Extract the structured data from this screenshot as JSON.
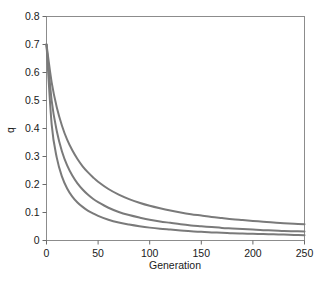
{
  "chart_data": {
    "type": "line",
    "title": "",
    "xlabel": "Generation",
    "ylabel": "q",
    "xlim": [
      0,
      250
    ],
    "ylim": [
      0,
      0.8
    ],
    "grid": false,
    "legend": "none",
    "frame": "full-box",
    "xticks": [
      0,
      50,
      100,
      150,
      200,
      250
    ],
    "xtick_labels": [
      "0",
      "50",
      "100",
      "150",
      "200",
      "250"
    ],
    "yticks": [
      0,
      0.1,
      0.2,
      0.3,
      0.4,
      0.5,
      0.6,
      0.7,
      0.8
    ],
    "ytick_labels": [
      "0",
      "0.1",
      "0.2",
      "0.3",
      "0.4",
      "0.5",
      "0.6",
      "0.7",
      "0.8"
    ],
    "line_color": "#7a7a7a",
    "line_width": 2.0,
    "x": [
      0,
      5,
      10,
      15,
      20,
      25,
      30,
      35,
      40,
      45,
      50,
      60,
      70,
      80,
      90,
      100,
      110,
      120,
      130,
      140,
      150,
      160,
      170,
      180,
      190,
      200,
      210,
      220,
      230,
      240,
      250
    ],
    "series": [
      {
        "name": "slow-decay",
        "values": [
          0.7,
          0.565,
          0.475,
          0.41,
          0.36,
          0.322,
          0.291,
          0.265,
          0.244,
          0.226,
          0.21,
          0.184,
          0.164,
          0.148,
          0.135,
          0.124,
          0.115,
          0.107,
          0.1,
          0.094,
          0.089,
          0.084,
          0.08,
          0.076,
          0.073,
          0.07,
          0.067,
          0.064,
          0.062,
          0.06,
          0.058
        ]
      },
      {
        "name": "medium-decay",
        "values": [
          0.7,
          0.5,
          0.39,
          0.318,
          0.268,
          0.232,
          0.204,
          0.182,
          0.164,
          0.149,
          0.137,
          0.117,
          0.102,
          0.091,
          0.082,
          0.074,
          0.068,
          0.063,
          0.058,
          0.054,
          0.051,
          0.048,
          0.045,
          0.043,
          0.041,
          0.039,
          0.037,
          0.036,
          0.034,
          0.033,
          0.032
        ]
      },
      {
        "name": "fast-decay",
        "values": [
          0.7,
          0.415,
          0.295,
          0.228,
          0.186,
          0.157,
          0.136,
          0.12,
          0.107,
          0.097,
          0.088,
          0.074,
          0.064,
          0.057,
          0.051,
          0.046,
          0.042,
          0.039,
          0.036,
          0.033,
          0.031,
          0.029,
          0.028,
          0.026,
          0.025,
          0.024,
          0.023,
          0.022,
          0.021,
          0.02,
          0.019
        ]
      }
    ]
  }
}
